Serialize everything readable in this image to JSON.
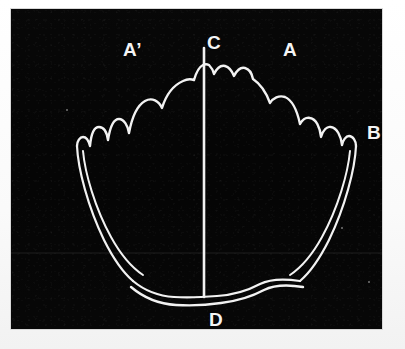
{
  "figure": {
    "background_color": "#050505",
    "line_color": "#f2f2f2",
    "page_color": "#fcfcfc",
    "plate": {
      "x": 11,
      "y": 9,
      "width": 371,
      "height": 320
    }
  },
  "labels": {
    "a_prime": "A’",
    "c": "C",
    "a": "A",
    "b": "B",
    "d": "D"
  },
  "label_positions": {
    "a_prime": {
      "x": 112,
      "y": 31
    },
    "c": {
      "x": 196,
      "y": 24
    },
    "a": {
      "x": 272,
      "y": 31
    },
    "b": {
      "x": 356,
      "y": 114
    },
    "d": {
      "x": 198,
      "y": 301
    }
  },
  "geometry": {
    "axis_line": {
      "name": "axis-c-d",
      "x": 193,
      "y_top": 39,
      "y_bottom": 288
    },
    "crenulated_margin_note": "Scalloped / wavy dorsal margin running from B on the right, over C at the apex, down the left side",
    "ventral_margin_note": "Two near-parallel gently undulating lines forming the ventral edge through D",
    "flank_note": "Paired lines descend from the lateral tips on both sides toward the ventral margin"
  }
}
